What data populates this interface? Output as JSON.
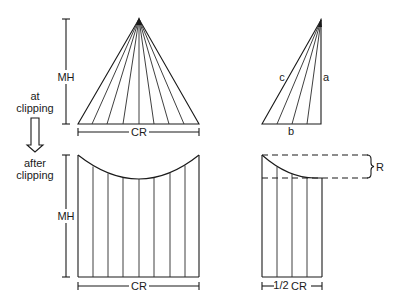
{
  "labels": {
    "at_clipping_line1": "at",
    "at_clipping_line2": "clipping",
    "after_clipping_line1": "after",
    "after_clipping_line2": "clipping",
    "mh_top": "MH",
    "mh_bottom": "MH",
    "cr_top": "CR",
    "cr_bottom": "CR",
    "side_c": "c",
    "side_a": "a",
    "side_b": "b",
    "half_cr_fraction": "1/2",
    "half_cr_text": "CR",
    "r_label": "R"
  },
  "panels": [
    {
      "name": "tree-cone-at-clipping",
      "description": "Full crown radius cone with branches radiating from apex"
    },
    {
      "name": "half-cone-at-clipping",
      "description": "Right triangle with sides a, b, c"
    },
    {
      "name": "tree-after-clipping",
      "description": "Rectangle with concave curved top, height MH, width CR"
    },
    {
      "name": "half-after-clipping",
      "description": "Half rectangle with curved top and dashed box marking R"
    }
  ],
  "colors": {
    "stroke": "#1a1a1a",
    "background": "#ffffff"
  }
}
